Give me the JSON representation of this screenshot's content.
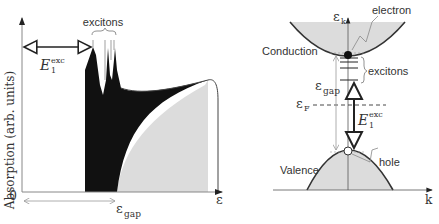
{
  "left_panel": {
    "ylabel": "Absorption (arb. units)",
    "origin_label": "0",
    "x_axis_label": "ε",
    "gap_label_main": "ε",
    "gap_label_sub": "gap",
    "exciton_label": "excitons",
    "energy_label_main": "E",
    "energy_label_sub": "1",
    "energy_label_sup": "exc"
  },
  "right_panel": {
    "y_axis_label_main": "ε",
    "y_axis_label_sub": "k",
    "x_axis_label": "k",
    "conduction_label": "Conduction",
    "valence_label": "Valence",
    "electron_label": "electron",
    "hole_label": "hole",
    "exciton_label": "excitons",
    "gap_label_main": "ε",
    "gap_label_sub": "gap",
    "fermi_label_main": "ε",
    "fermi_label_sub": "F",
    "energy_label_main": "E",
    "energy_label_sub": "1",
    "energy_label_sup": "exc"
  },
  "colors": {
    "black_fill": "#111111",
    "grey_fill": "#dcdcdc",
    "axis": "#333333",
    "thin_line": "#888888"
  }
}
